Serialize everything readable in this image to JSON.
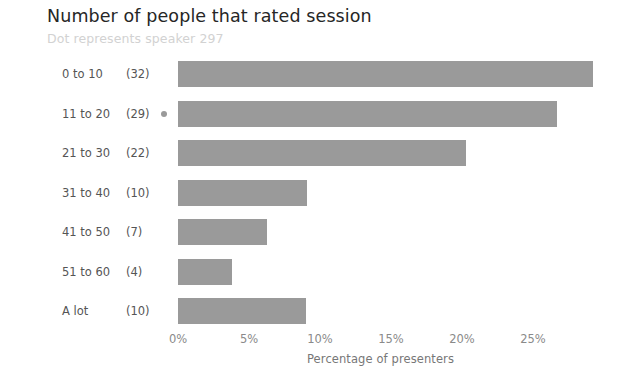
{
  "chart_data": {
    "type": "bar",
    "orientation": "horizontal",
    "title": "Number of people that rated session",
    "subtitle": "Dot represents speaker 297",
    "xlabel": "Percentage of presenters",
    "ylabel": "",
    "categories": [
      "0 to 10",
      "11 to 20",
      "21 to 30",
      "31 to 40",
      "41 to 50",
      "51 to 60",
      "A lot"
    ],
    "counts": [
      "(32)",
      "(29)",
      "(22)",
      "(10)",
      "(7)",
      "(4)",
      "(10)"
    ],
    "values": [
      29.2,
      26.7,
      20.3,
      9.1,
      6.3,
      3.8,
      9.0
    ],
    "xlim": [
      0,
      30
    ],
    "xticks": [
      0,
      5,
      10,
      15,
      20,
      25
    ],
    "xtick_labels": [
      "0%",
      "5%",
      "10%",
      "15%",
      "20%",
      "25%"
    ],
    "grid": false,
    "legend": null,
    "bar_color": "#9a9a9a",
    "marker": {
      "name": "speaker-297-dot",
      "category": "11 to 20",
      "color": "#9a9a9a"
    }
  },
  "style": {
    "background": "#ffffff",
    "title_color": "#262626",
    "subtitle_color": "#d2d2d2",
    "label_color": "#555555",
    "tick_color": "#8a8a8a",
    "axis_label_color": "#777777"
  }
}
